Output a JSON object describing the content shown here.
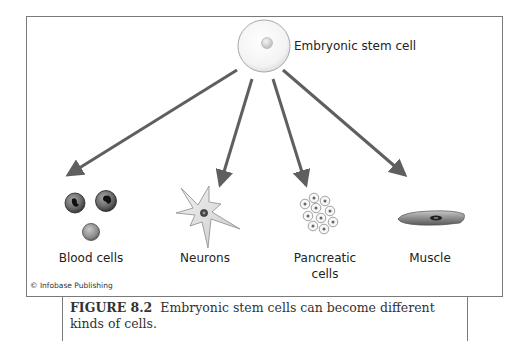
{
  "diagram": {
    "source": {
      "label": "Embryonic stem cell",
      "icon": "stem-cell-icon"
    },
    "targets": [
      {
        "id": "blood",
        "label": "Blood cells",
        "icon": "blood-cells-icon"
      },
      {
        "id": "neurons",
        "label": "Neurons",
        "icon": "neuron-icon"
      },
      {
        "id": "pancreatic",
        "label_line1": "Pancreatic",
        "label_line2": "cells",
        "icon": "pancreatic-cells-icon"
      },
      {
        "id": "muscle",
        "label": "Muscle",
        "icon": "muscle-cell-icon"
      }
    ],
    "credit": "© Infobase Publishing",
    "colors": {
      "arrow": "#5f5f5f",
      "frame": "#7a7a7a",
      "cell_fill": "#f0f0f0",
      "dark_cell": "#3c3c3c"
    }
  },
  "caption": {
    "figure_label": "FIGURE 8.2",
    "text": "Embryonic stem cells can become different kinds of cells."
  }
}
